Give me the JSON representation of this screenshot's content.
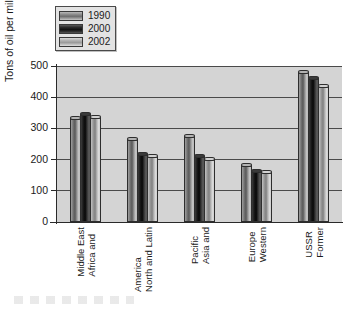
{
  "chart_data": {
    "type": "bar",
    "title": "",
    "subtitle": "",
    "xlabel": "",
    "ylabel": "Tons of oil per million dollars",
    "ylim": [
      0,
      500
    ],
    "yticks": [
      0,
      100,
      200,
      300,
      400,
      500
    ],
    "ytick_labels": [
      "0",
      "100",
      "200",
      "300",
      "400",
      "500"
    ],
    "grid": true,
    "legend_position": "top-left",
    "categories": [
      "Africa and Middle East",
      "North and Latin America",
      "Asia and Pacific",
      "Western Europe",
      "Former USSR"
    ],
    "category_lines": [
      [
        "Africa and",
        "Middle East"
      ],
      [
        "North and Latin",
        "America"
      ],
      [
        "Asia and",
        "Pacific"
      ],
      [
        "Western",
        "Europe"
      ],
      [
        "Former",
        "USSR"
      ]
    ],
    "series": [
      {
        "name": "1990",
        "color": "#6f6f6f",
        "values": [
          332,
          265,
          275,
          182,
          480
        ]
      },
      {
        "name": "2000",
        "color": "#121212",
        "values": [
          345,
          218,
          210,
          163,
          462
        ]
      },
      {
        "name": "2002",
        "color": "#b4b4b4",
        "values": [
          335,
          210,
          202,
          160,
          435
        ]
      }
    ]
  },
  "legend": {
    "items": [
      {
        "label": "1990",
        "swatch": "swatch-1990"
      },
      {
        "label": "2000",
        "swatch": "swatch-2000"
      },
      {
        "label": "2002",
        "swatch": "swatch-2002"
      }
    ]
  },
  "axes": {
    "y_title": "Tons of oil per million dollars",
    "y_tick_labels": [
      "500",
      "400",
      "300",
      "200",
      "100",
      "0"
    ]
  },
  "colors": {
    "plot_background": "#d4d4d4",
    "page_background": "#ffffff",
    "axis": "#2a2a2a",
    "gridline": "#4a4a4a",
    "series_1990": "#6f6f6f",
    "series_2000": "#121212",
    "series_2002": "#b4b4b4"
  }
}
